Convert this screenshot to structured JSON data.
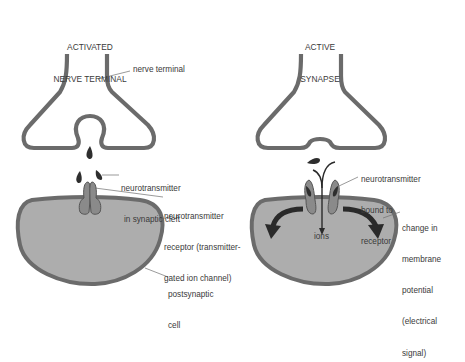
{
  "panels": {
    "left": {
      "title_line1": "ACTIVATED",
      "title_line2": "NERVE TERMINAL",
      "labels": {
        "nerve_terminal": "nerve terminal",
        "nt_cleft_1": "neurotransmitter",
        "nt_cleft_2": "in synaptic cleft",
        "receptor_1": "neurotransmitter",
        "receptor_2": "receptor (transmitter-",
        "receptor_3": "gated ion channel)",
        "post_1": "postsynaptic",
        "post_2": "cell"
      }
    },
    "right": {
      "title_line1": "ACTIVE",
      "title_line2": "SYNAPSE",
      "labels": {
        "bound_1": "neurotransmitter",
        "bound_2": "bound to",
        "bound_3": "receptor",
        "ions": "ions",
        "change_1": "change in",
        "change_2": "membrane",
        "change_3": "potential",
        "change_4": "(electrical",
        "change_5": "signal)"
      }
    }
  },
  "colors": {
    "outline": "#6b6b6b",
    "cell_fill": "#adadad",
    "receptor_fill": "#8a8a8a",
    "dark": "#2e2e2e",
    "text": "#3a3a3a",
    "leader": "#6f6f6f"
  }
}
